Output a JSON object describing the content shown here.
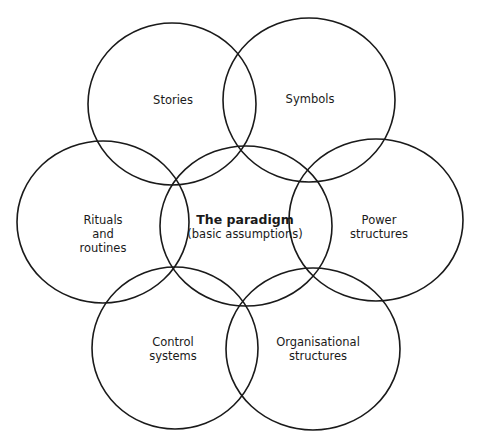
{
  "diagram": {
    "type": "venn-style cultural web",
    "stroke_color": "#1a1a1a",
    "background": "#ffffff",
    "circles": [
      {
        "id": "stories",
        "cx": 172,
        "cy": 104,
        "rx": 84,
        "ry": 81,
        "lines": [
          "Stories"
        ]
      },
      {
        "id": "symbols",
        "cx": 309,
        "cy": 100,
        "rx": 86,
        "ry": 82,
        "lines": [
          "Symbols"
        ]
      },
      {
        "id": "rituals",
        "cx": 103,
        "cy": 222,
        "rx": 86,
        "ry": 81,
        "lines": [
          "Rituals",
          "and",
          "routines"
        ]
      },
      {
        "id": "paradigm",
        "cx": 246,
        "cy": 226,
        "rx": 86,
        "ry": 80,
        "title": "The paradigm",
        "subtitle": "(basic assumptions)"
      },
      {
        "id": "power",
        "cx": 376,
        "cy": 220,
        "rx": 87,
        "ry": 81,
        "lines": [
          "Power",
          "structures"
        ]
      },
      {
        "id": "control",
        "cx": 175,
        "cy": 348,
        "rx": 83,
        "ry": 81,
        "lines": [
          "Control",
          "systems"
        ]
      },
      {
        "id": "organisational",
        "cx": 313,
        "cy": 349,
        "rx": 87,
        "ry": 81,
        "lines": [
          "Organisational",
          "structures"
        ]
      }
    ]
  },
  "labels": {
    "stories": [
      "Stories"
    ],
    "symbols": [
      "Symbols"
    ],
    "rituals": [
      "Rituals",
      "and",
      "routines"
    ],
    "paradigm_title": "The paradigm",
    "paradigm_subtitle": "(basic assumptions)",
    "power": [
      "Power",
      "structures"
    ],
    "control": [
      "Control",
      "systems"
    ],
    "organisational": [
      "Organisational",
      "structures"
    ]
  }
}
